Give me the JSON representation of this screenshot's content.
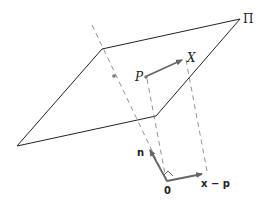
{
  "figure": {
    "plane_label": "Π",
    "point_p_label": "P",
    "point_x_label": "X",
    "normal_label": "n",
    "vector_label": "x − p",
    "origin_label": "0"
  },
  "colors": {
    "line": "#222222",
    "arrow": "#666666",
    "dashed": "#888888",
    "point": "#777777"
  }
}
